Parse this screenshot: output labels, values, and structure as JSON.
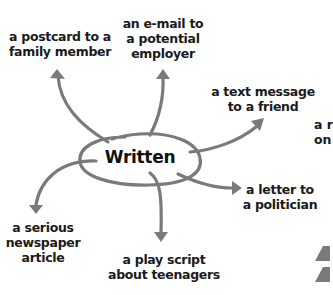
{
  "diagram": {
    "colors": {
      "arrow": "#7a7a7a",
      "text": "#1a1a1a",
      "triangle": "#808080"
    },
    "center": {
      "label": "Written",
      "icon": "hand-drawn-ellipse"
    },
    "branches": [
      {
        "id": "postcard",
        "lines": [
          "a postcard to a",
          "family member"
        ]
      },
      {
        "id": "email",
        "lines": [
          "an e-mail to",
          "a potential",
          "employer"
        ]
      },
      {
        "id": "text-message",
        "lines": [
          "a text message",
          "to a friend"
        ]
      },
      {
        "id": "letter",
        "lines": [
          "a letter to",
          "a politician"
        ]
      },
      {
        "id": "play-script",
        "lines": [
          "a play script",
          "about teenagers"
        ]
      },
      {
        "id": "newspaper",
        "lines": [
          "a serious",
          "newspaper",
          "article"
        ]
      }
    ],
    "cut_off_text": {
      "lines": [
        "a r",
        "on"
      ]
    },
    "side_markers": [
      "triangle-up-icon",
      "triangle-up-icon"
    ]
  }
}
